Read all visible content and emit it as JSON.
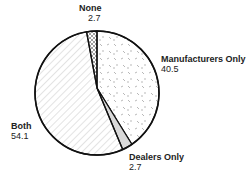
{
  "chart_data": {
    "type": "pie",
    "title": "",
    "slices": [
      {
        "label": "None",
        "value": 2.7,
        "pattern": "crosshatch",
        "color": "#ffffff"
      },
      {
        "label": "Manufacturers Only",
        "value": 40.5,
        "pattern": "random-dashes",
        "color": "#ffffff"
      },
      {
        "label": "Dealers Only",
        "value": 2.7,
        "pattern": "solid-light-gray",
        "color": "#d9d9d9"
      },
      {
        "label": "Both",
        "value": 54.1,
        "pattern": "diagonal-lines",
        "color": "#ffffff"
      }
    ],
    "labels": [
      "None",
      "Manufacturers Only",
      "Dealers Only",
      "Both"
    ],
    "values": [
      2.7,
      40.5,
      2.7,
      54.1
    ],
    "legend": "none (direct labels)",
    "start_angle": "12 o'clock, clockwise"
  },
  "labels": {
    "none": {
      "name": "None",
      "value": "2.7"
    },
    "manufacturers": {
      "name": "Manufacturers Only",
      "value": "40.5"
    },
    "dealers": {
      "name": "Dealers Only",
      "value": "2.7"
    },
    "both": {
      "name": "Both",
      "value": "54.1"
    }
  }
}
